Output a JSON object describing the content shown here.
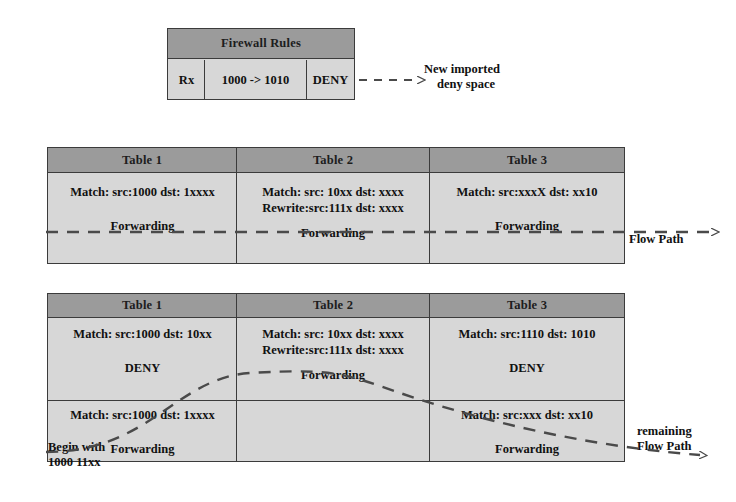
{
  "firewall": {
    "header": "Firewall Rules",
    "direction": "Rx",
    "rule": "1000 -> 1010",
    "action": "DENY",
    "annotation_line1": "New imported",
    "annotation_line2": "deny space"
  },
  "group_a": {
    "headers": [
      "Table 1",
      "Table 2",
      "Table 3"
    ],
    "cells": [
      {
        "lines": [
          "Match: src:1000 dst: 1xxxx"
        ],
        "forwarding": "Forwarding"
      },
      {
        "lines": [
          "Match: src: 10xx dst: xxxx",
          "Rewrite:src:111x dst: xxxx"
        ],
        "forwarding": "Forwarding"
      },
      {
        "lines": [
          "Match: src:xxxX dst: xx10"
        ],
        "forwarding": "Forwarding"
      }
    ],
    "flow_label": "Flow Path"
  },
  "group_b": {
    "headers": [
      "Table 1",
      "Table 2",
      "Table 3"
    ],
    "row1": [
      {
        "lines": [
          "Match: src:1000 dst: 10xx"
        ],
        "verdict": "DENY"
      },
      {
        "lines": [
          "Match: src: 10xx dst: xxxx",
          "Rewrite:src:111x dst: xxxx"
        ],
        "verdict": "Forwarding"
      },
      {
        "lines": [
          "Match: src:1110 dst: 1010"
        ],
        "verdict": "DENY"
      }
    ],
    "row2": [
      {
        "lines": [
          "Match: src:1000 dst: 1xxxx"
        ],
        "verdict": "Forwarding"
      },
      {
        "lines": [],
        "verdict": ""
      },
      {
        "lines": [
          "Match: src:xxx dst: xx10"
        ],
        "verdict": "Forwarding"
      }
    ],
    "begin_line1": "Begin with",
    "begin_line2": "1000 11xx",
    "flow_label_line1": "remaining",
    "flow_label_line2": "Flow Path"
  },
  "colors": {
    "header_gray": "#9b9b9b",
    "body_gray": "#d7d7d7",
    "line": "#3b3b3b",
    "text": "#111111"
  }
}
